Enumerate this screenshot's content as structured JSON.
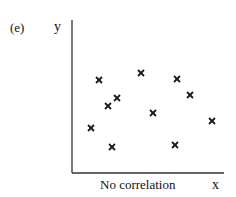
{
  "panel_label": "(e)",
  "caption": "No correlation",
  "chart_data": {
    "type": "scatter",
    "title": "No correlation",
    "panel": "(e)",
    "xlabel": "x",
    "ylabel": "y",
    "marker": "x",
    "grid": false,
    "legend": null,
    "axis_ticks": "none",
    "x_range_px": [
      72,
      224
    ],
    "y_range_px": [
      20,
      173
    ],
    "points_px": [
      {
        "x": 99,
        "y": 80
      },
      {
        "x": 141,
        "y": 73
      },
      {
        "x": 117,
        "y": 98
      },
      {
        "x": 108,
        "y": 106
      },
      {
        "x": 91,
        "y": 128
      },
      {
        "x": 112,
        "y": 147
      },
      {
        "x": 177,
        "y": 79
      },
      {
        "x": 190,
        "y": 95
      },
      {
        "x": 153,
        "y": 113
      },
      {
        "x": 212,
        "y": 121
      },
      {
        "x": 175,
        "y": 145
      }
    ]
  },
  "colors": {
    "axis": "#333333",
    "marker": "#1a1a1a",
    "background": "#ffffff"
  }
}
